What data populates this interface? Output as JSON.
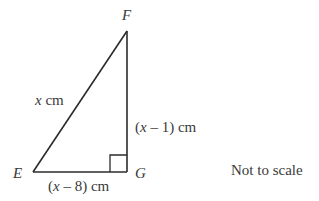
{
  "diagram": {
    "type": "right-triangle",
    "vertices": {
      "F": {
        "label": "F",
        "x": 127,
        "y": 31
      },
      "E": {
        "label": "E",
        "x": 33,
        "y": 172
      },
      "G": {
        "label": "G",
        "x": 127,
        "y": 172
      }
    },
    "right_angle_at": "G",
    "sides": {
      "EF": {
        "var": "x",
        "unit": " cm"
      },
      "FG": {
        "open": "(",
        "var": "x",
        "rest": " – 1)",
        "unit": " cm"
      },
      "EG": {
        "open": "(",
        "var": "x",
        "rest": " – 8)",
        "unit": " cm"
      }
    },
    "note": "Not to scale",
    "stroke_color": "#2b2b2b"
  }
}
